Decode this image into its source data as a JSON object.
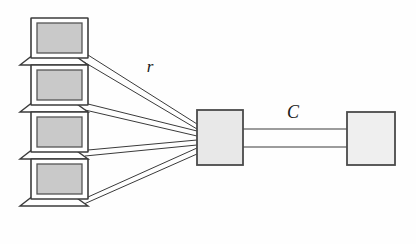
{
  "diagram": {
    "background_color": "#fefefe",
    "width": 416,
    "height": 244,
    "line_color": "#3a3a3a",
    "stroke_color": "#444444",
    "nodes": {
      "clients": {
        "icon_name": "laptop-computer-icon",
        "count": 4,
        "screen_fill": "#c9c9c9",
        "body_fill": "#ffffff",
        "outline": "#3c3c3c",
        "positions": [
          {
            "x": 30,
            "y": 18
          },
          {
            "x": 30,
            "y": 65
          },
          {
            "x": 30,
            "y": 112
          },
          {
            "x": 30,
            "y": 159
          }
        ]
      },
      "router": {
        "node_name": "router-box",
        "x": 197,
        "y": 110,
        "width": 46,
        "height": 55,
        "fill": "#e8e8e8",
        "outline": "#4a4a4a"
      },
      "server": {
        "node_name": "server-box",
        "x": 347,
        "y": 112,
        "width": 48,
        "height": 53,
        "fill": "#efefef",
        "outline": "#4a4a4a"
      }
    },
    "labels": {
      "access_rate": "r",
      "access_rate_x": 150,
      "access_rate_y": 72,
      "link_capacity": "C",
      "link_capacity_x": 293,
      "link_capacity_y": 118,
      "font_size": 17
    },
    "links": {
      "client_to_router": {
        "link_name": "access-link",
        "style": "double-line",
        "count": 4,
        "rate_label": "r"
      },
      "router_to_server": {
        "link_name": "backbone-link",
        "style": "double-line",
        "capacity_label": "C",
        "top_line_y": 129,
        "bottom_line_y": 147,
        "x_start": 243,
        "x_end": 347
      }
    }
  }
}
